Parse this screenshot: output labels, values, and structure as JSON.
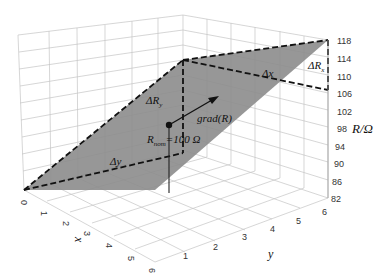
{
  "diagram": {
    "type": "3d-surface-plane",
    "z_axis": {
      "label": "R/Ω",
      "ticks": [
        "118",
        "114",
        "110",
        "106",
        "102",
        "98",
        "94",
        "90",
        "86",
        "82"
      ]
    },
    "x_axis": {
      "label": "x",
      "ticks": [
        "0",
        "1",
        "2",
        "3",
        "4",
        "5",
        "6"
      ]
    },
    "y_axis": {
      "label": "y",
      "ticks": [
        "1",
        "2",
        "3",
        "4",
        "5",
        "6"
      ]
    },
    "annotations": {
      "delta_rx": "ΔR",
      "delta_rx_sub": "x",
      "delta_ry": "ΔR",
      "delta_ry_sub": "y",
      "delta_x": "Δx",
      "delta_y": "Δy",
      "gradient": "grad(R)",
      "r_nom": "R",
      "r_nom_sub": "nom",
      "r_nom_value": "=100 Ω"
    },
    "colors": {
      "surface": "#8c8c8c",
      "grid": "#bdbdbd",
      "dashed": "#111111"
    }
  }
}
